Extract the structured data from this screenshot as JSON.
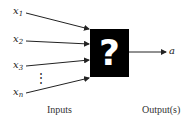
{
  "diagram": {
    "inputs": [
      {
        "base": "x",
        "sub": "1"
      },
      {
        "base": "x",
        "sub": "2"
      },
      {
        "base": "x",
        "sub": "3"
      },
      {
        "base": "x",
        "sub": "n"
      }
    ],
    "ellipsis": "⋮",
    "box_symbol": "?",
    "output_label": "a",
    "captions": {
      "inputs": "Inputs",
      "outputs": "Output(s)"
    },
    "colors": {
      "box": "#000000",
      "symbol": "#ffffff",
      "lines": "#222222"
    }
  }
}
